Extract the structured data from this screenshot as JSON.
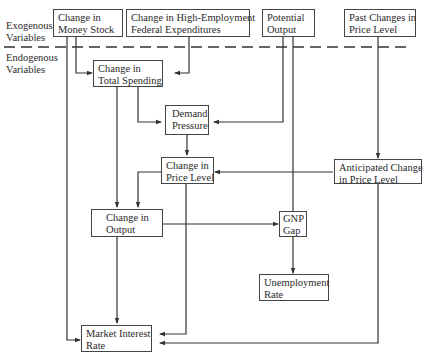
{
  "diagram": {
    "region_labels": {
      "exogenous": [
        "Exogenous",
        "Variables"
      ],
      "endogenous": [
        "Endogenous",
        "Variables"
      ]
    },
    "nodes": {
      "money_stock": [
        "Change in",
        "Money Stock"
      ],
      "federal_expenditures": [
        "Change in High-Employment",
        "Federal Expenditures"
      ],
      "potential_output": [
        "Potential",
        "Output"
      ],
      "past_price_changes": [
        "Past Changes in",
        "Price Level"
      ],
      "total_spending": [
        "Change in",
        "Total Spending"
      ],
      "demand_pressure": [
        "Demand",
        "Pressure"
      ],
      "price_level": [
        "Change in",
        "Price Level"
      ],
      "anticipated_price": [
        "Anticipated Change",
        "in Price Level"
      ],
      "output": [
        "Change in",
        "Output"
      ],
      "gnp_gap": [
        "GNP",
        "Gap"
      ],
      "unemployment": [
        "Unemployment",
        "Rate"
      ],
      "interest_rate": [
        "Market Interest",
        "Rate"
      ]
    },
    "edges": [
      [
        "money_stock",
        "total_spending"
      ],
      [
        "money_stock",
        "interest_rate"
      ],
      [
        "federal_expenditures",
        "total_spending"
      ],
      [
        "potential_output",
        "demand_pressure"
      ],
      [
        "potential_output",
        "gnp_gap"
      ],
      [
        "past_price_changes",
        "anticipated_price"
      ],
      [
        "total_spending",
        "demand_pressure"
      ],
      [
        "total_spending",
        "output"
      ],
      [
        "demand_pressure",
        "price_level"
      ],
      [
        "anticipated_price",
        "price_level"
      ],
      [
        "anticipated_price",
        "interest_rate"
      ],
      [
        "price_level",
        "output"
      ],
      [
        "price_level",
        "interest_rate"
      ],
      [
        "output",
        "gnp_gap"
      ],
      [
        "output",
        "interest_rate"
      ],
      [
        "gnp_gap",
        "unemployment"
      ]
    ]
  }
}
